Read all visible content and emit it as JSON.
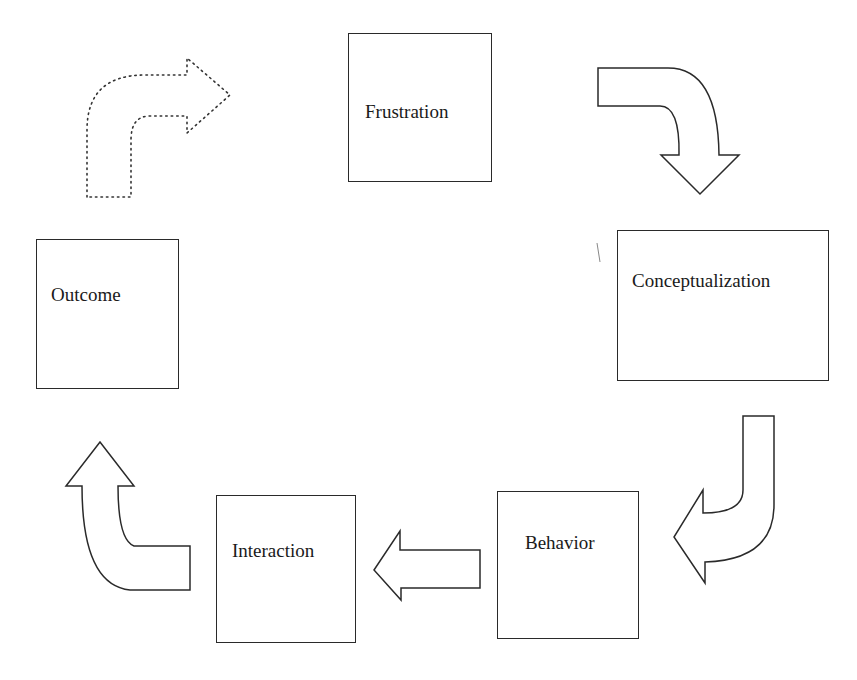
{
  "diagram": {
    "type": "cycle",
    "nodes": [
      {
        "id": "frustration",
        "label": "Frustration"
      },
      {
        "id": "conceptualization",
        "label": "Conceptualization"
      },
      {
        "id": "behavior",
        "label": "Behavior"
      },
      {
        "id": "interaction",
        "label": "Interaction"
      },
      {
        "id": "outcome",
        "label": "Outcome"
      }
    ],
    "edges": [
      {
        "from": "frustration",
        "to": "conceptualization",
        "style": "solid",
        "shape": "curved-arrow"
      },
      {
        "from": "conceptualization",
        "to": "behavior",
        "style": "solid",
        "shape": "curved-arrow"
      },
      {
        "from": "behavior",
        "to": "interaction",
        "style": "solid",
        "shape": "block-arrow"
      },
      {
        "from": "interaction",
        "to": "outcome",
        "style": "solid",
        "shape": "curved-arrow"
      },
      {
        "from": "outcome",
        "to": "frustration",
        "style": "dotted",
        "shape": "curved-arrow"
      }
    ],
    "colors": {
      "stroke": "#2a2a2a",
      "fill": "#ffffff",
      "text": "#1a1a1a"
    }
  }
}
